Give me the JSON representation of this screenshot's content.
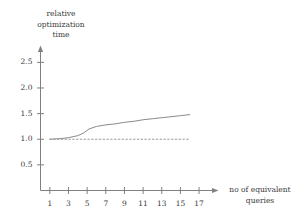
{
  "figure": {
    "background": "#ffffff",
    "axis_color": "#808080",
    "curve_color": "#8a8a8a",
    "reference_color": "#9a9a9a",
    "text_color": "#3a3a3a"
  },
  "chart_data": {
    "type": "line",
    "title": "",
    "ylabel": "relative\noptimization\ntime",
    "xlabel": "no of equivalent\nqueries",
    "xlim": [
      0,
      18.6
    ],
    "ylim": [
      0,
      2.78
    ],
    "grid": false,
    "legend": null,
    "xticks": [
      1,
      3,
      5,
      7,
      9,
      11,
      13,
      15,
      17
    ],
    "xtick_labels": [
      "1",
      "3",
      "5",
      "7",
      "9",
      "11",
      "13",
      "15",
      "17"
    ],
    "yticks": [
      0.5,
      1.0,
      1.5,
      2.0,
      2.5
    ],
    "ytick_labels": [
      "0.5",
      "1.0",
      "1.5",
      "2.0",
      "2.5"
    ],
    "series": [
      {
        "name": "relative optimization time",
        "style": "solid",
        "x": [
          1,
          2,
          3,
          4,
          4.6,
          5.2,
          6,
          7,
          8,
          9,
          10,
          11,
          12,
          13,
          14,
          15,
          16
        ],
        "values": [
          1.0,
          1.01,
          1.03,
          1.07,
          1.12,
          1.2,
          1.25,
          1.28,
          1.3,
          1.33,
          1.35,
          1.38,
          1.4,
          1.42,
          1.44,
          1.46,
          1.48
        ]
      },
      {
        "name": "baseline",
        "style": "dotted",
        "x": [
          1,
          16
        ],
        "values": [
          1.0,
          1.0
        ]
      }
    ]
  }
}
